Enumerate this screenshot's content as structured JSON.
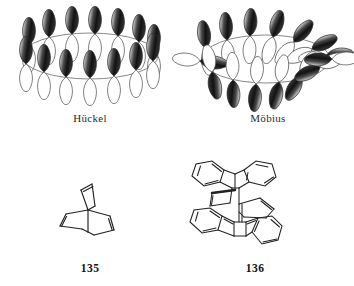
{
  "figure": {
    "background": "#ffffff",
    "ink": "#1a1a1a"
  },
  "panels": [
    {
      "id": "huckel",
      "caption": "Hückel",
      "kind": "orbital-ring",
      "description": "planar untwisted cyclic array of p-orbitals on an ellipse",
      "orbital_count": 14,
      "twist": "none",
      "lobe_colors": {
        "top": "#1c1c1c",
        "bottom": "#ffffff",
        "outline": "#3a3a3a"
      },
      "ring_color": "#6b6b6b"
    },
    {
      "id": "mobius",
      "caption": "Möbius",
      "kind": "orbital-ring",
      "description": "cyclic array of p-orbitals with a half twist, orbitals rotate progressively",
      "orbital_count": 14,
      "twist": "half-turn",
      "lobe_colors": {
        "top": "#1c1c1c",
        "bottom": "#ffffff",
        "outline": "#3a3a3a"
      },
      "ring_color": "#6b6b6b"
    }
  ],
  "structures": [
    {
      "id": "s135",
      "number": "135",
      "name": "barrelene",
      "description": "bicyclo[2.2.2]octa-2,5,7-triene, three double bonds between two bridgehead carbons"
    },
    {
      "id": "s136",
      "number": "136",
      "name": "tribenzo-fused barrelene dimer",
      "description": "two triptycene-like benzo-fused bicyclic units joined through a central alkene bridge"
    }
  ]
}
